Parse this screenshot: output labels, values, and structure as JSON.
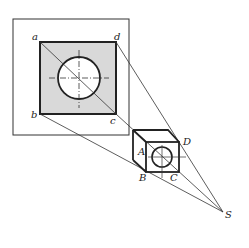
{
  "diagram": {
    "type": "perspective-projection",
    "colors": {
      "line": "#222222",
      "fill": "#d9d9d9",
      "background": "#ffffff"
    },
    "labels": {
      "a": "a",
      "b": "b",
      "c": "c",
      "d": "d",
      "A": "A",
      "B": "B",
      "C": "C",
      "D": "D",
      "S": "S"
    }
  }
}
